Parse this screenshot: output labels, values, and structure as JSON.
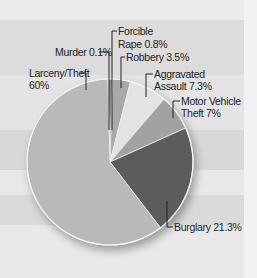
{
  "chart_data": {
    "type": "pie",
    "title": "",
    "categories": [
      "Murder",
      "Forcible Rape",
      "Robbery",
      "Aggravated Assault",
      "Motor Vehicle Theft",
      "Burglary",
      "Larceny/Theft"
    ],
    "values": [
      0.1,
      0.8,
      3.5,
      7.3,
      7,
      21.3,
      60
    ],
    "unit": "%",
    "colors": [
      "#6a6a6a",
      "#8c8c8c",
      "#a9a9a9",
      "#e3e3e3",
      "#a2a2a2",
      "#5b5b5b",
      "#b9b9b9"
    ],
    "start_angle_deg": 0,
    "direction": "clockwise",
    "legend": "none (callout labels)",
    "labels": [
      {
        "category": "Murder",
        "line1": "Murder 0.1%",
        "line2": ""
      },
      {
        "category": "Forcible Rape",
        "line1": "Forcible",
        "line2": "Rape 0.8%"
      },
      {
        "category": "Robbery",
        "line1": "Robbery 3.5%",
        "line2": ""
      },
      {
        "category": "Aggravated Assault",
        "line1": "Aggravated",
        "line2": "Assault 7.3%"
      },
      {
        "category": "Motor Vehicle Theft",
        "line1": "Motor Vehicle",
        "line2": "Theft 7%"
      },
      {
        "category": "Burglary",
        "line1": "Burglary 21.3%",
        "line2": ""
      },
      {
        "category": "Larceny/Theft",
        "line1": "Larceny/Theft",
        "line2": "60%"
      }
    ]
  },
  "background": {
    "stripes": [
      {
        "top": 0,
        "height": 20,
        "color": "#ebebeb"
      },
      {
        "top": 20,
        "height": 55,
        "color": "#dcdcdc"
      },
      {
        "top": 75,
        "height": 55,
        "color": "#e4e4e4"
      },
      {
        "top": 130,
        "height": 40,
        "color": "#d8d8d8"
      },
      {
        "top": 170,
        "height": 25,
        "color": "#e8e8e8"
      },
      {
        "top": 195,
        "height": 30,
        "color": "#dadada"
      },
      {
        "top": 225,
        "height": 53,
        "color": "#e9e9e9"
      }
    ]
  }
}
